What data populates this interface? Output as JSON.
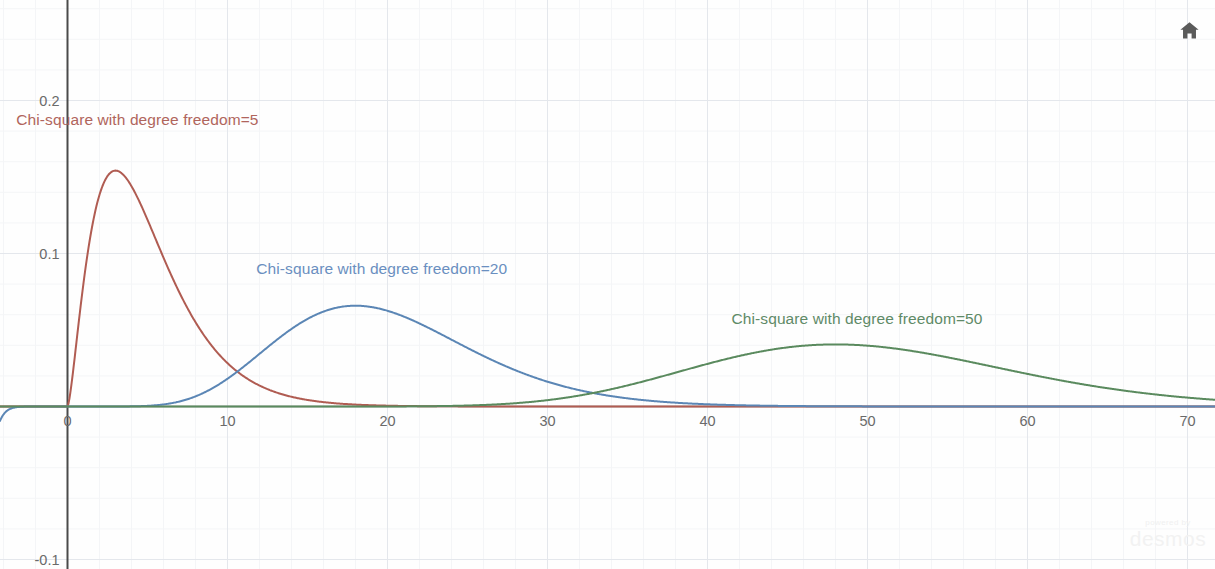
{
  "app": {
    "title": "Chi-square distributions",
    "home_icon": "home-icon",
    "watermark_powered": "powered by",
    "watermark_brand": "desmos"
  },
  "axes": {
    "x_ticks": [
      "0",
      "10",
      "20",
      "30",
      "40",
      "50",
      "60",
      "70"
    ],
    "y_ticks": [
      "0.2",
      "0.1",
      "-0.1"
    ]
  },
  "labels": {
    "df5": "Chi-square with degree freedom=5",
    "df20": "Chi-square with degree freedom=20",
    "df50": "Chi-square with degree freedom=50"
  },
  "chart_data": {
    "type": "line",
    "title": "",
    "xlabel": "",
    "ylabel": "",
    "xlim": [
      -4.2,
      71.8
    ],
    "ylim": [
      -0.106,
      0.265
    ],
    "grid": true,
    "grid_step_x": 10,
    "grid_step_y": 0.1,
    "legend_position": "inline-annotations",
    "x_ticks": [
      0,
      10,
      20,
      30,
      40,
      50,
      60,
      70
    ],
    "y_ticks": [
      0.2,
      0.1,
      -0.1
    ],
    "series": [
      {
        "name": "Chi-square with degree freedom=5",
        "color": "#b05c52",
        "df": 5,
        "peak": {
          "x": 3.0,
          "y": 0.1542
        },
        "x": [
          0,
          0.5,
          1,
          1.5,
          2,
          2.5,
          3,
          3.5,
          4,
          4.5,
          5,
          6,
          7,
          8,
          9,
          10,
          11,
          12,
          13,
          14,
          15,
          16,
          17,
          18,
          20,
          22,
          24,
          26,
          28,
          30,
          35,
          40,
          45,
          50,
          60,
          70,
          71.8
        ],
        "values": [
          0,
          0.0812,
          0.144,
          0.1655,
          0.162,
          0.1466,
          0.1255,
          0.1036,
          0.0833,
          0.0657,
          0.0512,
          0.0299,
          0.017,
          0.0095,
          0.0052,
          0.0028,
          0.0015,
          0.0008,
          0.0004,
          0.0002,
          0.0001,
          6e-05,
          3e-05,
          2e-05,
          5e-06,
          1e-06,
          0,
          0,
          0,
          0,
          0,
          0,
          0,
          0,
          0,
          0,
          0
        ]
      },
      {
        "name": "Chi-square with degree freedom=20",
        "color": "#5b86b5",
        "df": 20,
        "peak": {
          "x": 18.0,
          "y": 0.0649
        },
        "x": [
          0,
          2,
          4,
          6,
          8,
          10,
          11,
          12,
          13,
          14,
          15,
          16,
          17,
          18,
          19,
          20,
          21,
          22,
          24,
          26,
          28,
          30,
          32,
          34,
          36,
          38,
          40,
          44,
          48,
          52,
          56,
          60,
          65,
          70,
          71.8
        ],
        "values": [
          0,
          2e-05,
          0.0005,
          0.0033,
          0.011,
          0.025,
          0.0321,
          0.0389,
          0.045,
          0.0502,
          0.0545,
          0.0578,
          0.0602,
          0.0617,
          0.0623,
          0.0625,
          0.062,
          0.061,
          0.0575,
          0.0525,
          0.0468,
          0.0405,
          0.0343,
          0.0283,
          0.0228,
          0.0181,
          0.0141,
          0.0082,
          0.0045,
          0.0024,
          0.0012,
          0.0006,
          0.0002,
          7e-05,
          5e-05
        ]
      },
      {
        "name": "Chi-square with degree freedom=50",
        "color": "#5a8a5e",
        "df": 50,
        "peak": {
          "x": 48.0,
          "y": 0.0396
        },
        "x": [
          0,
          5,
          10,
          15,
          20,
          24,
          28,
          30,
          32,
          34,
          36,
          38,
          40,
          42,
          44,
          46,
          48,
          50,
          52,
          54,
          56,
          58,
          60,
          62,
          64,
          66,
          68,
          70,
          71.8
        ],
        "values": [
          0,
          0,
          1e-06,
          6e-05,
          0.0008,
          0.0036,
          0.0097,
          0.0139,
          0.0186,
          0.0233,
          0.0278,
          0.0318,
          0.0351,
          0.0375,
          0.039,
          0.0397,
          0.0396,
          0.0389,
          0.0376,
          0.0358,
          0.0337,
          0.0313,
          0.0288,
          0.0262,
          0.0236,
          0.0211,
          0.0187,
          0.0164,
          0.0155
        ]
      }
    ],
    "annotations": [
      {
        "text": "Chi-square with degree freedom=5",
        "x": -3.2,
        "y": 0.187,
        "color": "#b0655c"
      },
      {
        "text": "Chi-square with degree freedom=20",
        "x": 11.8,
        "y": 0.09,
        "color": "#6a8fc0"
      },
      {
        "text": "Chi-square with degree freedom=50",
        "x": 41.5,
        "y": 0.057,
        "color": "#5f8a67"
      }
    ]
  }
}
